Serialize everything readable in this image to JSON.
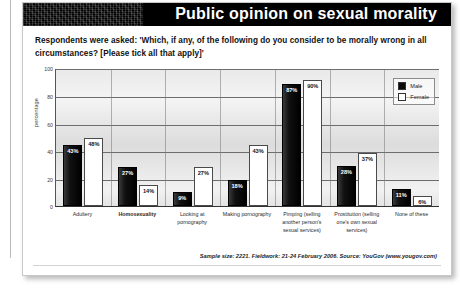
{
  "header": {
    "title": "Public opinion on sexual morality"
  },
  "question": "Respondents were asked: 'Which, if any, of the following do you consider to be morally wrong in all circumstances? [Please tick all that apply]'",
  "footer": {
    "source_note": "Sample size: 2221. Fieldwork: 21-24 February 2006. Source: YouGov (www.yougov.com)"
  },
  "legend": {
    "position": "top-right",
    "items": [
      {
        "label": "Male",
        "swatch": "male-swatch",
        "color": "#0b0b0b"
      },
      {
        "label": "Female",
        "swatch": "female-swatch",
        "color": "#ffffff"
      }
    ]
  },
  "chart_data": {
    "type": "bar",
    "title": "Public opinion on sexual morality",
    "xlabel": "",
    "ylabel": "percentage",
    "ylim": [
      0,
      100
    ],
    "yticks": [
      0,
      20,
      40,
      60,
      80,
      100
    ],
    "grid": true,
    "categories": [
      "Adultery",
      "Homosexuality",
      "Looking at pornography",
      "Making pornography",
      "Pimping (selling another person's sexual services)",
      "Prostitution (selling one's own sexual services)",
      "None of these"
    ],
    "emphasised_category": "Homosexuality",
    "series": [
      {
        "name": "Male",
        "values": [
          43,
          27,
          9,
          18,
          87,
          28,
          11
        ]
      },
      {
        "name": "Female",
        "values": [
          48,
          14,
          27,
          43,
          90,
          37,
          6
        ]
      }
    ],
    "value_labels": {
      "Male": [
        "43%",
        "27%",
        "9%",
        "18%",
        "87%",
        "28%",
        "11%"
      ],
      "Female": [
        "48%",
        "14%",
        "27%",
        "43%",
        "90%",
        "37%",
        "6%"
      ]
    }
  }
}
